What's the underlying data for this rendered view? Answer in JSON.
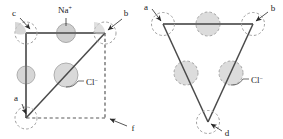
{
  "figure": {
    "type": "crystal-structure-diagram",
    "background_color": "#ffffff",
    "line_color": "#595959",
    "ion_fill_color": "#d9d9d9",
    "ion_outline_color": "#9a9a9a",
    "label_color": "#1a1a1a"
  },
  "left_panel": {
    "name": "square-cell",
    "shape": "square",
    "corner_labels": [
      {
        "id": "c",
        "text": "c",
        "position": "top-left"
      },
      {
        "id": "b",
        "text": "b",
        "position": "top-right"
      },
      {
        "id": "a",
        "text": "a",
        "position": "bottom-left"
      },
      {
        "id": "f",
        "text": "f",
        "position": "bottom-right"
      }
    ],
    "ion_labels": [
      {
        "id": "na",
        "text": "Na",
        "charge": "+",
        "target": "top-edge-midpoint-ion"
      },
      {
        "id": "cl",
        "text": "Cl",
        "charge": "−",
        "target": "center-ion"
      }
    ],
    "edges": [
      {
        "id": "top",
        "style": "solid"
      },
      {
        "id": "left",
        "style": "solid"
      },
      {
        "id": "diagonal",
        "style": "solid",
        "from": "a",
        "to": "b"
      },
      {
        "id": "right",
        "style": "dashed"
      },
      {
        "id": "bottom",
        "style": "dashed"
      }
    ],
    "ions": [
      {
        "id": "corner-c",
        "kind": "Cl",
        "render": "dashed-outline-quarter",
        "at": "top-left"
      },
      {
        "id": "corner-b",
        "kind": "Cl",
        "render": "dashed-outline-quarter",
        "at": "top-right"
      },
      {
        "id": "corner-a",
        "kind": "Cl",
        "render": "dashed-outline-quarter",
        "at": "bottom-left"
      },
      {
        "id": "top-mid",
        "kind": "Na",
        "render": "half-shaded",
        "at": "top-edge-midpoint"
      },
      {
        "id": "left-mid",
        "kind": "Na",
        "render": "half-shaded",
        "at": "left-edge-midpoint"
      },
      {
        "id": "center",
        "kind": "Cl",
        "render": "shaded",
        "at": "center"
      }
    ]
  },
  "right_panel": {
    "name": "triangular-section",
    "shape": "triangle",
    "corner_labels": [
      {
        "id": "a",
        "text": "a",
        "position": "top-left"
      },
      {
        "id": "b",
        "text": "b",
        "position": "top-right"
      },
      {
        "id": "d",
        "text": "d",
        "position": "bottom"
      }
    ],
    "ion_labels": [
      {
        "id": "cl",
        "text": "Cl",
        "charge": "−",
        "target": "right-edge-midpoint-ion"
      }
    ],
    "edges": [
      {
        "id": "top",
        "style": "solid"
      },
      {
        "id": "left",
        "style": "solid"
      },
      {
        "id": "right",
        "style": "solid"
      }
    ],
    "ions": [
      {
        "id": "vertex-a",
        "kind": "Cl",
        "render": "dashed-outline",
        "at": "top-left"
      },
      {
        "id": "vertex-b",
        "kind": "Cl",
        "render": "dashed-outline",
        "at": "top-right"
      },
      {
        "id": "vertex-d",
        "kind": "Cl",
        "render": "dashed-outline",
        "at": "bottom"
      },
      {
        "id": "top-mid",
        "kind": "Cl",
        "render": "dashed-shaded",
        "at": "top-edge-midpoint"
      },
      {
        "id": "left-mid",
        "kind": "Cl",
        "render": "dashed-shaded",
        "at": "left-edge-midpoint"
      },
      {
        "id": "right-mid",
        "kind": "Cl",
        "render": "dashed-shaded",
        "at": "right-edge-midpoint"
      }
    ]
  }
}
